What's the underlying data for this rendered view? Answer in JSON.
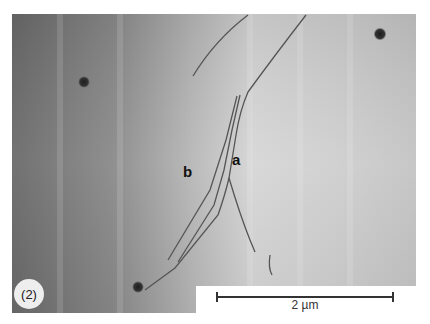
{
  "figure": {
    "panel_label": "(2)",
    "feature_labels": [
      {
        "id": "a",
        "text": "a"
      },
      {
        "id": "b",
        "text": "b"
      }
    ],
    "scale_bar": {
      "label": "2 µm"
    },
    "colors": {
      "background_dark": "#6f6f6f",
      "background_light": "#d8d8d8",
      "line": "#555555",
      "spot": "#2a2a2a"
    }
  }
}
